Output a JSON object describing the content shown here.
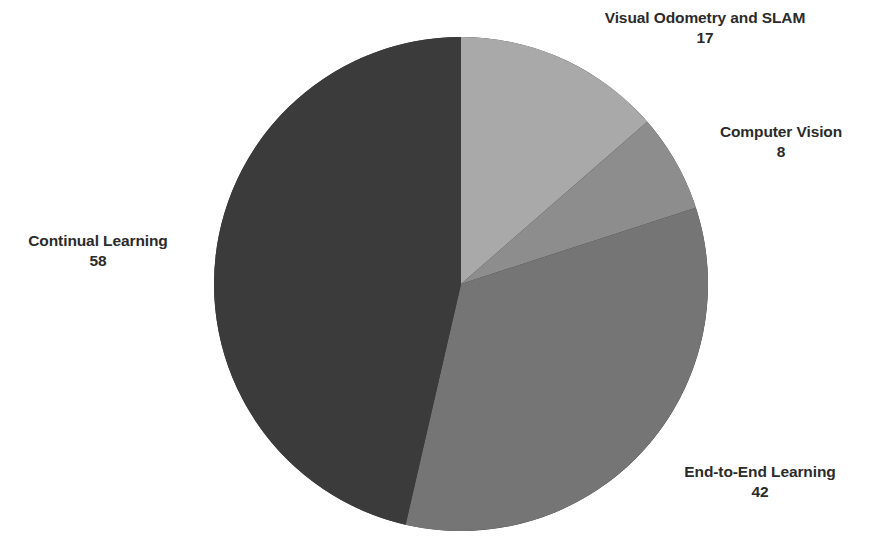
{
  "chart_data": {
    "type": "pie",
    "title": "",
    "subtitle": "",
    "xlabel": "",
    "ylabel": "",
    "grid": false,
    "legend_position": "outside-labels",
    "total": 125,
    "start_angle_deg": 0,
    "direction": "clockwise",
    "labels": [
      "Visual Odometry and SLAM",
      "Computer Vision",
      "End-to-End Learning",
      "Continual Learning"
    ],
    "values": [
      17,
      8,
      42,
      58
    ],
    "colors": [
      "#a9a9a9",
      "#8d8d8d",
      "#757575",
      "#3b3b3b"
    ],
    "slices": [
      {
        "label": "Visual Odometry and SLAM",
        "value": 17,
        "value_text": "17",
        "color": "#a9a9a9",
        "percent": 13.6
      },
      {
        "label": "Computer Vision",
        "value": 8,
        "value_text": "8",
        "color": "#8d8d8d",
        "percent": 6.4
      },
      {
        "label": "End-to-End Learning",
        "value": 42,
        "value_text": "42",
        "color": "#757575",
        "percent": 33.6
      },
      {
        "label": "Continual Learning",
        "value": 58,
        "value_text": "58",
        "color": "#3b3b3b",
        "percent": 46.4
      }
    ]
  },
  "geometry": {
    "center_x": 461,
    "center_y": 284,
    "radius": 247
  },
  "style": {
    "background": "#ffffff",
    "label_color": "#2b2b2b"
  }
}
